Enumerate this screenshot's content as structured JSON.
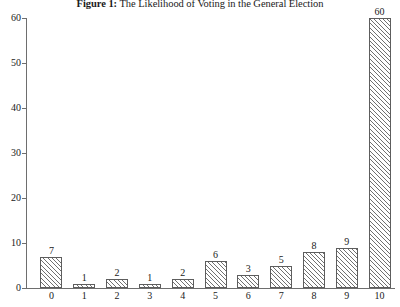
{
  "chart_data": {
    "type": "bar",
    "title": "Figure 1: The Likelihood of Voting in the General Election",
    "title_label": "Figure 1:",
    "title_text": "The Likelihood of Voting in the General Election",
    "xlabel": "",
    "ylabel": "",
    "categories": [
      "0",
      "1",
      "2",
      "3",
      "4",
      "5",
      "6",
      "7",
      "8",
      "9",
      "10"
    ],
    "values": [
      7,
      1,
      2,
      1,
      2,
      6,
      3,
      5,
      8,
      9,
      60
    ],
    "data_labels": [
      "7",
      "1",
      "2",
      "1",
      "2",
      "6",
      "3",
      "5",
      "8",
      "9",
      "60"
    ],
    "ylim": [
      0,
      60
    ],
    "xlim": [
      -0.6,
      10.6
    ],
    "y_ticks": [
      0,
      10,
      20,
      30,
      40,
      50,
      60
    ],
    "y_tick_labels": [
      "0",
      "10",
      "20",
      "30",
      "40",
      "50",
      "60"
    ],
    "x_tick_labels": [
      "0",
      "1",
      "2",
      "3",
      "4",
      "5",
      "6",
      "7",
      "8",
      "9",
      "10"
    ],
    "grid": false,
    "legend": false,
    "legend_position": "none",
    "bar_fill": "#ffffff",
    "bar_hatch": "diagonal-lines",
    "bar_edge_color": "#5d5d5d",
    "axis_color": "#6e6e6e",
    "text_color": "#1a1a1a",
    "background": "#ffffff"
  }
}
